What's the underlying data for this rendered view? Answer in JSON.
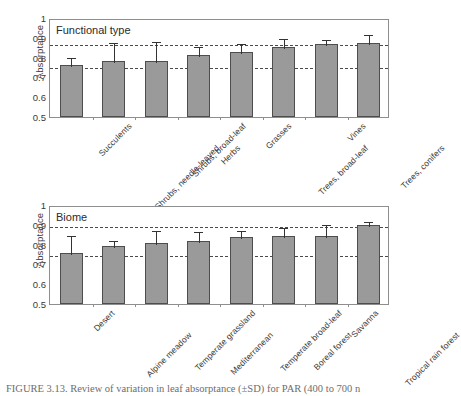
{
  "figure": {
    "caption": "FIGURE 3.13. Review of variation in leaf absorptance (±SD) for PAR (400 to 700 n",
    "caption_clipped": true
  },
  "panels": [
    {
      "id": "functional",
      "title": "Functional type",
      "ylabel": "Absorptance",
      "yticks": [
        "1",
        "0.9",
        "0.8",
        "0.7",
        "0.6",
        "0.5"
      ],
      "categories": [
        "Succulents",
        "Shrubs, needle-leaved",
        "Shrubs, broad-leaf",
        "Herbs",
        "Grasses",
        "Trees, broad-leaf",
        "Vines",
        "Trees, conifers"
      ]
    },
    {
      "id": "biome",
      "title": "Biome",
      "ylabel": "Absorptance",
      "yticks": [
        "1",
        "0.9",
        "0.8",
        "0.7",
        "0.6",
        "0.5"
      ],
      "categories": [
        "Desert",
        "Alpine meadow",
        "Temperate grassland",
        "Mediterranean",
        "Temperate broad-leaf",
        "Boreal forest",
        "Savanna",
        "Tropical rain forest"
      ]
    }
  ],
  "chart_data": [
    {
      "type": "bar",
      "title": "Functional type",
      "xlabel": "",
      "ylabel": "Absorptance",
      "ylim": [
        0.5,
        1.0
      ],
      "ytick_values": [
        0.5,
        0.6,
        0.7,
        0.8,
        0.9,
        1.0
      ],
      "grid": false,
      "legend": "none",
      "error_bars": "+SD (upper only)",
      "bar_color": "#9a9a9a",
      "bar_edge_color": "#4d4d4d",
      "reference_lines": [
        {
          "value": 0.757,
          "style": "dashed"
        },
        {
          "value": 0.875,
          "style": "dashed"
        }
      ],
      "categories": [
        "Succulents",
        "Shrubs, needle-leaved",
        "Shrubs, broad-leaf",
        "Herbs",
        "Grasses",
        "Trees, broad-leaf",
        "Vines",
        "Trees, conifers"
      ],
      "values": [
        0.763,
        0.784,
        0.784,
        0.811,
        0.828,
        0.856,
        0.871,
        0.876
      ],
      "errors": [
        0.047,
        0.098,
        0.105,
        0.055,
        0.052,
        0.048,
        0.03,
        0.046
      ]
    },
    {
      "type": "bar",
      "title": "Biome",
      "xlabel": "",
      "ylabel": "Absorptance",
      "ylim": [
        0.5,
        1.0
      ],
      "ytick_values": [
        0.5,
        0.6,
        0.7,
        0.8,
        0.9,
        1.0
      ],
      "grid": false,
      "legend": "none",
      "error_bars": "+SD (upper only)",
      "bar_color": "#9a9a9a",
      "bar_edge_color": "#4d4d4d",
      "reference_lines": [
        {
          "value": 0.755,
          "style": "dashed"
        },
        {
          "value": 0.897,
          "style": "dashed"
        }
      ],
      "categories": [
        "Desert",
        "Alpine meadow",
        "Temperate grassland",
        "Mediterranean",
        "Temperate broad-leaf",
        "Boreal forest",
        "Savanna",
        "Tropical rain forest"
      ],
      "values": [
        0.757,
        0.794,
        0.807,
        0.816,
        0.84,
        0.844,
        0.843,
        0.897
      ],
      "errors": [
        0.097,
        0.035,
        0.072,
        0.056,
        0.04,
        0.051,
        0.068,
        0.025
      ]
    }
  ]
}
